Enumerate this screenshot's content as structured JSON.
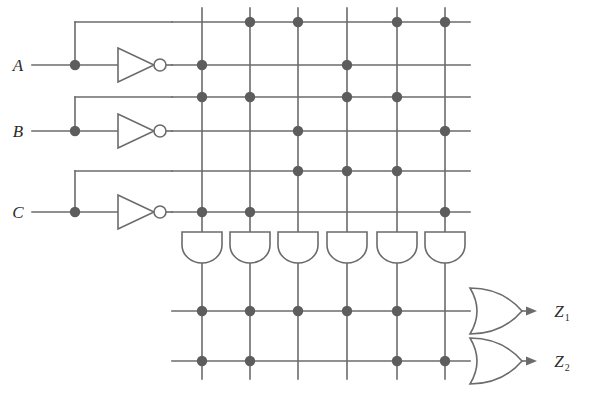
{
  "diagram": {
    "type": "programmable-logic-array",
    "colors": {
      "wire": "#6b6b6b",
      "dot": "#5d5d5d",
      "label": "#2b2b2b",
      "background": "#ffffff"
    }
  },
  "inputs": [
    {
      "id": "A",
      "label": "A",
      "y": 65,
      "tap_x": 75,
      "branch_y": 22,
      "inverter_out_y": 65
    },
    {
      "id": "B",
      "label": "B",
      "y": 131,
      "tap_x": 75,
      "branch_y": 97,
      "inverter_out_y": 131
    },
    {
      "id": "C",
      "label": "C",
      "y": 212,
      "tap_x": 75,
      "branch_y": 171,
      "inverter_out_y": 212
    }
  ],
  "inverters": [
    {
      "id": "inv-A",
      "input": "A",
      "output": "A-not"
    },
    {
      "id": "inv-B",
      "input": "B",
      "output": "B-not"
    },
    {
      "id": "inv-C",
      "input": "C",
      "output": "C-not"
    }
  ],
  "input_rows": [
    {
      "index": 1,
      "signal": "A",
      "y": 22
    },
    {
      "index": 2,
      "signal": "A'",
      "y": 65
    },
    {
      "index": 3,
      "signal": "B",
      "y": 97
    },
    {
      "index": 4,
      "signal": "B'",
      "y": 131
    },
    {
      "index": 5,
      "signal": "C",
      "y": 171
    },
    {
      "index": 6,
      "signal": "C'",
      "y": 212
    }
  ],
  "product_columns": [
    {
      "index": 1,
      "x": 202
    },
    {
      "index": 2,
      "x": 250
    },
    {
      "index": 3,
      "x": 298
    },
    {
      "index": 4,
      "x": 347
    },
    {
      "index": 5,
      "x": 397
    },
    {
      "index": 6,
      "x": 445
    }
  ],
  "and_plane_connections": [
    {
      "row": 1,
      "columns": [
        2,
        3,
        5,
        6
      ]
    },
    {
      "row": 2,
      "columns": [
        1,
        4
      ]
    },
    {
      "row": 3,
      "columns": [
        1,
        2,
        4,
        5
      ]
    },
    {
      "row": 4,
      "columns": [
        3,
        6
      ]
    },
    {
      "row": 5,
      "columns": [
        3,
        4,
        5
      ]
    },
    {
      "row": 6,
      "columns": [
        1,
        2,
        6
      ]
    }
  ],
  "and_gates": [
    {
      "id": "and-1",
      "column": 1
    },
    {
      "id": "and-2",
      "column": 2
    },
    {
      "id": "and-3",
      "column": 3
    },
    {
      "id": "and-4",
      "column": 4
    },
    {
      "id": "and-5",
      "column": 5
    },
    {
      "id": "and-6",
      "column": 6
    }
  ],
  "or_plane_rows": [
    {
      "index": 1,
      "output": "Z1",
      "y": 311,
      "columns": [
        1,
        2,
        3,
        4,
        5
      ]
    },
    {
      "index": 2,
      "output": "Z2",
      "y": 361,
      "columns": [
        1,
        2,
        5,
        6
      ]
    }
  ],
  "or_gates": [
    {
      "id": "or-1",
      "output": "Z1",
      "y": 311
    },
    {
      "id": "or-2",
      "output": "Z2",
      "y": 361
    }
  ],
  "outputs": [
    {
      "id": "Z1",
      "base": "Z",
      "subscript": "1",
      "x": 562,
      "y": 311
    },
    {
      "id": "Z2",
      "base": "Z",
      "subscript": "2",
      "x": 562,
      "y": 361
    }
  ],
  "geometry": {
    "input_label_x": 18,
    "input_line_start_x": 32,
    "inverter_x": 118,
    "inverter_width": 36,
    "inverter_height": 34,
    "bubble_radius": 6,
    "grid_left": 178,
    "grid_right": 470,
    "grid_top": 8,
    "and_gate_top": 232,
    "and_gate_bottom": 263,
    "and_gate_width": 40,
    "or_gate_x": 470,
    "or_gate_width": 52,
    "or_gate_height": 46,
    "dot_radius": 5.2
  }
}
